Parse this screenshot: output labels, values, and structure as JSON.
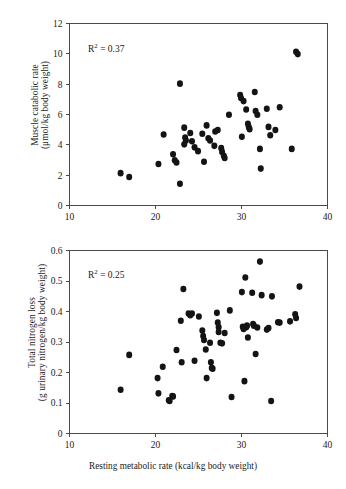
{
  "figure": {
    "background": "#ffffff",
    "point_color": "#141414",
    "axis_color": "#4a4a4a"
  },
  "chart_data": [
    {
      "type": "scatter",
      "panel": "top",
      "title": "",
      "xlabel": "Resting metabolic rate (kcal/kg body weight)",
      "ylabel_line1": "Muscle catabolic rate",
      "ylabel_line2": "(μmol/kg body weight)",
      "annotation": "R² = 0.37",
      "annotation_base": "R",
      "annotation_sup": "2",
      "annotation_rest": " = 0.37",
      "xlim": [
        10,
        40
      ],
      "ylim": [
        0,
        12
      ],
      "xticks": [
        10,
        20,
        30,
        40
      ],
      "yticks": [
        0,
        2,
        4,
        6,
        8,
        10,
        12
      ],
      "xticklabels": [
        "10",
        "20",
        "30",
        "40"
      ],
      "yticklabels": [
        "0",
        "2",
        "4",
        "6",
        "8",
        "10",
        "12"
      ],
      "grid": false,
      "legend": "none",
      "points": [
        [
          16.0,
          2.1
        ],
        [
          17.0,
          1.85
        ],
        [
          20.4,
          2.7
        ],
        [
          21.0,
          4.65
        ],
        [
          22.1,
          3.35
        ],
        [
          22.3,
          2.95
        ],
        [
          22.5,
          2.8
        ],
        [
          22.9,
          8.0
        ],
        [
          22.9,
          1.4
        ],
        [
          23.4,
          5.1
        ],
        [
          23.5,
          4.45
        ],
        [
          23.6,
          4.25
        ],
        [
          23.4,
          4.0
        ],
        [
          24.1,
          4.75
        ],
        [
          24.3,
          4.2
        ],
        [
          24.6,
          3.8
        ],
        [
          25.0,
          3.55
        ],
        [
          25.5,
          4.7
        ],
        [
          25.7,
          2.85
        ],
        [
          26.0,
          5.25
        ],
        [
          26.2,
          4.4
        ],
        [
          26.4,
          4.25
        ],
        [
          26.9,
          3.9
        ],
        [
          27.0,
          4.85
        ],
        [
          27.3,
          4.95
        ],
        [
          27.7,
          3.75
        ],
        [
          27.8,
          3.5
        ],
        [
          28.0,
          3.25
        ],
        [
          28.1,
          3.1
        ],
        [
          28.6,
          5.95
        ],
        [
          29.9,
          7.25
        ],
        [
          30.0,
          7.05
        ],
        [
          30.1,
          4.5
        ],
        [
          30.3,
          6.85
        ],
        [
          30.6,
          6.3
        ],
        [
          30.8,
          5.35
        ],
        [
          30.9,
          5.15
        ],
        [
          31.0,
          5.0
        ],
        [
          31.6,
          7.45
        ],
        [
          31.7,
          6.2
        ],
        [
          31.9,
          5.95
        ],
        [
          32.2,
          3.7
        ],
        [
          32.3,
          2.4
        ],
        [
          33.0,
          6.35
        ],
        [
          33.2,
          5.15
        ],
        [
          33.4,
          4.6
        ],
        [
          34.0,
          4.95
        ],
        [
          34.5,
          6.45
        ],
        [
          35.9,
          3.7
        ],
        [
          36.4,
          10.1
        ],
        [
          36.6,
          9.95
        ]
      ]
    },
    {
      "type": "scatter",
      "panel": "bottom",
      "title": "",
      "xlabel": "Resting metabolic rate (kcal/kg body weight)",
      "ylabel_line1": "Total nitrogen loss",
      "ylabel_line2": "(g urinary nitrogen/kg body weight)",
      "annotation": "R² = 0.25",
      "annotation_base": "R",
      "annotation_sup": "2",
      "annotation_rest": " = 0.25",
      "xlim": [
        10,
        40
      ],
      "ylim": [
        0,
        0.6
      ],
      "xticks": [
        10,
        20,
        30,
        40
      ],
      "yticks": [
        0,
        0.1,
        0.2,
        0.3,
        0.4,
        0.5,
        0.6
      ],
      "xticklabels": [
        "10",
        "20",
        "30",
        "40"
      ],
      "yticklabels": [
        "0",
        "0.1",
        "0.2",
        "0.3",
        "0.4",
        "0.5",
        "0.6"
      ],
      "grid": false,
      "legend": "none",
      "points": [
        [
          16.0,
          0.142
        ],
        [
          17.0,
          0.256
        ],
        [
          20.3,
          0.18
        ],
        [
          20.4,
          0.13
        ],
        [
          20.9,
          0.217
        ],
        [
          21.6,
          0.107
        ],
        [
          21.7,
          0.105
        ],
        [
          22.0,
          0.121
        ],
        [
          22.1,
          0.12
        ],
        [
          22.5,
          0.272
        ],
        [
          23.0,
          0.368
        ],
        [
          23.1,
          0.232
        ],
        [
          23.3,
          0.472
        ],
        [
          23.9,
          0.392
        ],
        [
          24.1,
          0.386
        ],
        [
          24.3,
          0.392
        ],
        [
          24.6,
          0.237
        ],
        [
          25.1,
          0.382
        ],
        [
          25.5,
          0.336
        ],
        [
          25.6,
          0.318
        ],
        [
          25.7,
          0.305
        ],
        [
          25.9,
          0.274
        ],
        [
          26.0,
          0.18
        ],
        [
          26.4,
          0.296
        ],
        [
          26.5,
          0.232
        ],
        [
          26.6,
          0.213
        ],
        [
          26.7,
          0.211
        ],
        [
          27.2,
          0.394
        ],
        [
          27.3,
          0.362
        ],
        [
          27.4,
          0.347
        ],
        [
          27.4,
          0.331
        ],
        [
          27.6,
          0.296
        ],
        [
          27.8,
          0.294
        ],
        [
          28.1,
          0.328
        ],
        [
          28.7,
          0.402
        ],
        [
          28.9,
          0.118
        ],
        [
          30.1,
          0.462
        ],
        [
          30.2,
          0.348
        ],
        [
          30.3,
          0.341
        ],
        [
          30.5,
          0.51
        ],
        [
          30.6,
          0.347
        ],
        [
          30.7,
          0.352
        ],
        [
          30.4,
          0.17
        ],
        [
          30.8,
          0.313
        ],
        [
          31.3,
          0.46
        ],
        [
          31.4,
          0.357
        ],
        [
          31.5,
          0.352
        ],
        [
          31.7,
          0.259
        ],
        [
          31.9,
          0.346
        ],
        [
          32.2,
          0.562
        ],
        [
          32.4,
          0.452
        ],
        [
          33.0,
          0.339
        ],
        [
          33.2,
          0.344
        ],
        [
          33.5,
          0.105
        ],
        [
          33.6,
          0.448
        ],
        [
          34.3,
          0.363
        ],
        [
          34.5,
          0.362
        ],
        [
          35.7,
          0.366
        ],
        [
          36.3,
          0.389
        ],
        [
          36.4,
          0.377
        ],
        [
          36.8,
          0.48
        ]
      ]
    }
  ]
}
